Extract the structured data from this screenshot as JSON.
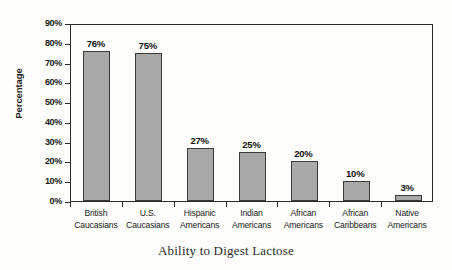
{
  "chart_data": {
    "type": "bar",
    "title": "",
    "xlabel": "Ability to Digest Lactose",
    "ylabel": "Percentage",
    "categories": [
      "British Caucasians",
      "U.S. Caucasians",
      "Hispanic Americans",
      "Indian Americans",
      "African Americans",
      "African Caribbeans",
      "Native Americans"
    ],
    "category_lines": [
      [
        "British",
        "Caucasians"
      ],
      [
        "U.S.",
        "Caucasians"
      ],
      [
        "Hispanic",
        "Americans"
      ],
      [
        "Indian",
        "Americans"
      ],
      [
        "African",
        "Americans"
      ],
      [
        "African",
        "Caribbeans"
      ],
      [
        "Native",
        "Americans"
      ]
    ],
    "values": [
      76,
      75,
      27,
      25,
      20,
      10,
      3
    ],
    "value_labels": [
      "76%",
      "75%",
      "27%",
      "25%",
      "20%",
      "10%",
      "3%"
    ],
    "ylim": [
      0,
      90
    ],
    "ytick_values": [
      0,
      10,
      20,
      30,
      40,
      50,
      60,
      70,
      80,
      90
    ],
    "ytick_labels": [
      "0%",
      "10%",
      "20%",
      "30%",
      "40%",
      "50%",
      "60%",
      "70%",
      "80%",
      "90%"
    ],
    "grid": false,
    "legend": "none",
    "bar_fill_color": "#a9a9a9",
    "bar_edge_color": "#3a3a3a",
    "axis_color": "#2b2b2b",
    "background_color": "#fdfdfb"
  }
}
